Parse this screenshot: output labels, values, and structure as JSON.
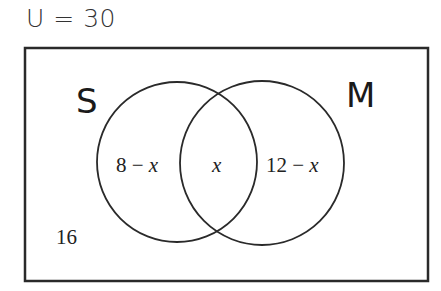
{
  "universe": {
    "label": "U = 30",
    "total": 30
  },
  "sets": [
    {
      "name": "S",
      "label": "S"
    },
    {
      "name": "M",
      "label": "M"
    }
  ],
  "regions": {
    "s_only": {
      "num": "8",
      "minus": " − ",
      "var": "x"
    },
    "intersection": {
      "var": "x"
    },
    "m_only": {
      "num": "12",
      "minus": " − ",
      "var": "x"
    },
    "outside": {
      "value": "16"
    }
  },
  "colors": {
    "stroke": "#2a2a2a",
    "background": "#ffffff"
  }
}
